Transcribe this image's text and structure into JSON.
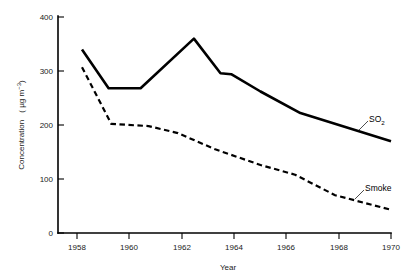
{
  "chart_data": {
    "type": "line",
    "title": "",
    "xlabel": "Year",
    "ylabel": "Concentration  ( µg m⁻³ )",
    "ylabel_main": "Concentration",
    "ylabel_units": "( µg m",
    "ylabel_exp": "−3",
    "ylabel_close": ")",
    "xlim": [
      1957.5,
      1970
    ],
    "ylim": [
      0,
      400
    ],
    "grid": false,
    "legend_position": "inline-right-annotations",
    "x_ticks": [
      1958,
      1960,
      1962,
      1964,
      1966,
      1968,
      1970
    ],
    "x_tick_labels": [
      "1958",
      "1960",
      "1962",
      "1964",
      "1966",
      "1968",
      "1970"
    ],
    "y_ticks": [
      0,
      100,
      200,
      300,
      400
    ],
    "y_tick_labels": [
      "0",
      "100",
      "200",
      "300",
      "400"
    ],
    "series": [
      {
        "name": "SO2",
        "label": "SO",
        "label_sub": "2",
        "style": "solid",
        "color": "#000000",
        "x": [
          1958.4,
          1959.4,
          1960.6,
          1962.6,
          1963.6,
          1964.0,
          1965.1,
          1966.6,
          1970.0
        ],
        "values": [
          340,
          268,
          268,
          360,
          296,
          294,
          262,
          222,
          170
        ]
      },
      {
        "name": "Smoke",
        "label": "Smoke",
        "style": "dashed",
        "color": "#000000",
        "x": [
          1958.4,
          1959.5,
          1960.9,
          1962.0,
          1963.4,
          1965.1,
          1966.4,
          1967.9,
          1970.0
        ],
        "values": [
          307,
          202,
          198,
          185,
          155,
          126,
          108,
          70,
          43
        ]
      }
    ],
    "annotations": [
      {
        "text": "SO2",
        "x": 1969.0,
        "y": 208
      },
      {
        "text": "Smoke",
        "x": 1968.3,
        "y": 80
      }
    ]
  }
}
